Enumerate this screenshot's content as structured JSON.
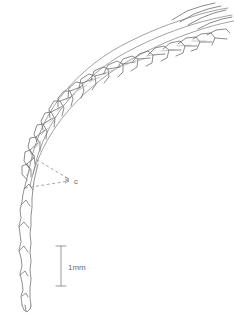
{
  "figure": {
    "kind": "scientific-line-drawing",
    "background_color": "#ffffff",
    "ink_color": "#7a7a7a",
    "ink_color_dark": "#5e5e5e",
    "label_color": "#6b6b6b",
    "width": 234,
    "height": 327
  },
  "annotations": {
    "callout": {
      "label": "c",
      "label_x": 74,
      "label_y": 181,
      "font_size": 8,
      "leader_lines": [
        {
          "from_x": 32,
          "from_y": 157,
          "to_x": 70,
          "to_y": 179
        },
        {
          "from_x": 25,
          "from_y": 188,
          "to_x": 70,
          "to_y": 181
        }
      ],
      "dash_pattern": "3,2.5"
    }
  },
  "scale_bar": {
    "label": "1mm",
    "label_x": 68,
    "label_y": 268,
    "font_size": 8,
    "x": 61,
    "y_top": 246,
    "y_bottom": 286,
    "cap_half_width": 5
  },
  "geometry": {
    "main_axis": "M 26,303 L 24,288 L 23,262 L 23,236 L 24,212 L 26,192 L 29,172 L 33,152 L 39,132 L 47,112 L 57,93 L 70,74 L 86,57 L 104,42 L 124,30 L 146,21 L 168,14 L 190,9 L 212,6",
    "outer_arc": "M 28,300 L 27,272 L 27,244 L 28,216 L 31,190 L 36,166 L 44,144 L 55,123 L 69,103 L 86,84 L 106,68 L 128,54 L 152,43 L 176,34 L 200,27 L 222,22",
    "inner_arc": "M 30,188 L 37,170 L 47,150 L 60,130 L 76,111 L 95,93 L 116,77 L 139,63 L 163,51 L 187,41 L 209,33",
    "smooth_sweep": "M 34,178 L 44,158 L 57,138 L 73,118 L 92,99 L 113,82 L 137,67 L 162,54 L 187,44 L 211,36 L 232,31",
    "leaf_count": 22
  }
}
